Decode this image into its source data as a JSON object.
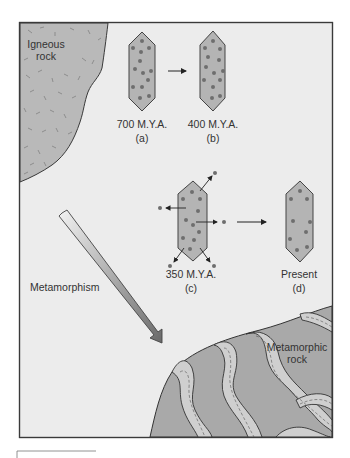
{
  "figure": {
    "labels": {
      "igneous_line1": "Igneous",
      "igneous_line2": "rock",
      "metamorphism": "Metamorphism",
      "metamorphic_line1": "Metamorphic",
      "metamorphic_line2": "rock"
    },
    "stages": [
      {
        "id": "a",
        "age": "700 M.Y.A.",
        "letter": "(a)"
      },
      {
        "id": "b",
        "age": "400 M.Y.A.",
        "letter": "(b)"
      },
      {
        "id": "c",
        "age": "350 M.Y.A.",
        "letter": "(c)"
      },
      {
        "id": "d",
        "age": "Present",
        "letter": "(d)"
      }
    ],
    "colors": {
      "background": "#ececec",
      "frame": "#3a3a3a",
      "igneous_fill": "#b9b9b9",
      "crystal_fill": "#b4b4b4",
      "crystal_dot": "#6e6e6e",
      "metamorphic_dark": "#a9a9a9",
      "metamorphic_light": "#cfcfcf",
      "arrow_fill": "#9a9a9a"
    }
  }
}
